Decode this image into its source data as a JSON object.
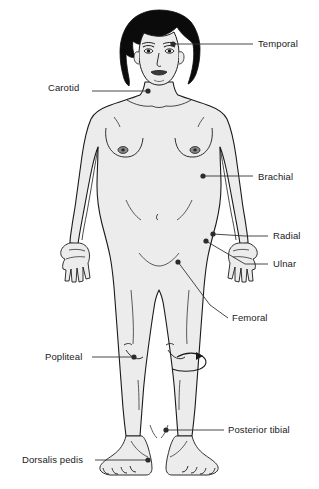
{
  "diagram": {
    "background_color": "#ffffff",
    "body_fill_color": "#ececec",
    "outline_color": "#1a1a1a",
    "hair_color": "#0b0b0b",
    "label_color": "#1a1a1a",
    "leader_line_color": "#333333",
    "pulse_dot_color": "#2b2b2b"
  },
  "labels": [
    {
      "id": "temporal",
      "text": "Temporal",
      "x": 258,
      "y": 39,
      "align": "left",
      "dot": {
        "x": 173,
        "y": 44
      },
      "leader": [
        [
          173,
          44
        ],
        [
          208,
          44
        ],
        [
          253,
          44
        ]
      ]
    },
    {
      "id": "carotid",
      "text": "Carotid",
      "x": 48,
      "y": 83,
      "align": "left",
      "dot": {
        "x": 148,
        "y": 91
      },
      "leader": [
        [
          148,
          91
        ],
        [
          110,
          91
        ],
        [
          92,
          91
        ]
      ]
    },
    {
      "id": "brachial",
      "text": "Brachial",
      "x": 258,
      "y": 172,
      "align": "left",
      "dot": {
        "x": 203,
        "y": 176
      },
      "leader": [
        [
          203,
          176
        ],
        [
          230,
          176
        ],
        [
          253,
          176
        ]
      ]
    },
    {
      "id": "radial",
      "text": "Radial",
      "x": 273,
      "y": 231,
      "align": "left",
      "dot": {
        "x": 213,
        "y": 234
      },
      "leader": [
        [
          213,
          234
        ],
        [
          245,
          236
        ],
        [
          268,
          236
        ]
      ]
    },
    {
      "id": "ulnar",
      "text": "Ulnar",
      "x": 273,
      "y": 259,
      "align": "left",
      "dot": {
        "x": 206,
        "y": 241
      },
      "leader": [
        [
          206,
          241
        ],
        [
          245,
          264
        ],
        [
          268,
          264
        ]
      ]
    },
    {
      "id": "femoral",
      "text": "Femoral",
      "x": 232,
      "y": 313,
      "align": "left",
      "dot": {
        "x": 178,
        "y": 262
      },
      "leader": [
        [
          178,
          262
        ],
        [
          210,
          305
        ],
        [
          228,
          318
        ]
      ]
    },
    {
      "id": "popliteal",
      "text": "Popliteal",
      "x": 45,
      "y": 352,
      "align": "left",
      "dot": {
        "x": 134,
        "y": 357
      },
      "leader": [
        [
          134,
          357
        ],
        [
          110,
          357
        ],
        [
          92,
          357
        ]
      ]
    },
    {
      "id": "posterior-tibial",
      "text": "Posterior tibial",
      "x": 228,
      "y": 425,
      "align": "left",
      "dot": {
        "x": 166,
        "y": 430
      },
      "leader": [
        [
          166,
          430
        ],
        [
          200,
          430
        ],
        [
          224,
          430
        ]
      ]
    },
    {
      "id": "dorsalis-pedis",
      "text": "Dorsalis pedis",
      "x": 22,
      "y": 455,
      "align": "left",
      "dot": {
        "x": 148,
        "y": 460
      },
      "leader": [
        [
          148,
          460
        ],
        [
          120,
          460
        ],
        [
          95,
          460
        ]
      ]
    }
  ],
  "annotations": {
    "knee_arrow": {
      "name": "popliteal-rotation-arrow",
      "description": "curved arrow wrapping behind the knee indicating posterior approach"
    }
  }
}
